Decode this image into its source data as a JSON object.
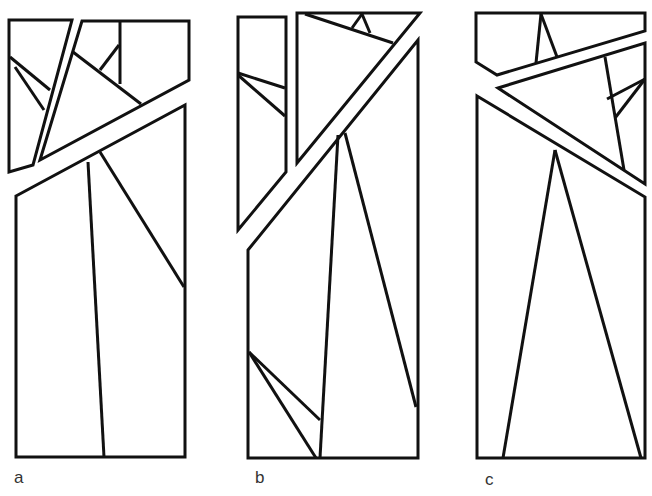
{
  "figure": {
    "stroke_color": "#111111",
    "background": "#ffffff",
    "panels": [
      {
        "id": "a",
        "label": "a",
        "pieces": [
          "9,20 72,20 33,165 9,172",
          "82,21 189,21 189,80 40,160",
          "16,196 185,105 185,457 16,457"
        ],
        "lines": [
          [
            10,
            57,
            50,
            90
          ],
          [
            15,
            67,
            44,
            110
          ],
          [
            73,
            52,
            141,
            104
          ],
          [
            120,
            22,
            120,
            84
          ],
          [
            100,
            70,
            119,
            45
          ],
          [
            88,
            162,
            104,
            457
          ],
          [
            100,
            152,
            184,
            287
          ]
        ]
      },
      {
        "id": "b",
        "label": "b",
        "pieces": [
          "238,17 286,17 286,172 238,230",
          "297,13 420,13 297,163",
          "248,250 418,40 418,458 248,458"
        ],
        "lines": [
          [
            238,
            73,
            285,
            88
          ],
          [
            238,
            75,
            285,
            116
          ],
          [
            305,
            14,
            393,
            43
          ],
          [
            362,
            14,
            352,
            28
          ],
          [
            362,
            14,
            370,
            33
          ],
          [
            338,
            135,
            320,
            458
          ],
          [
            345,
            133,
            416,
            407
          ],
          [
            249,
            352,
            320,
            420
          ],
          [
            249,
            352,
            316,
            458
          ]
        ]
      },
      {
        "id": "c",
        "label": "c",
        "pieces": [
          "476,13 645,13 645,31 497,75 476,62",
          "498,88 645,43 645,184",
          "477,96 645,197 645,458 477,458"
        ],
        "lines": [
          [
            541,
            14,
            536,
            63
          ],
          [
            541,
            14,
            557,
            57
          ],
          [
            605,
            57,
            624,
            170
          ],
          [
            607,
            99,
            645,
            79
          ],
          [
            615,
            118,
            645,
            79
          ],
          [
            555,
            150,
            503,
            458
          ],
          [
            555,
            150,
            641,
            458
          ]
        ]
      }
    ]
  }
}
